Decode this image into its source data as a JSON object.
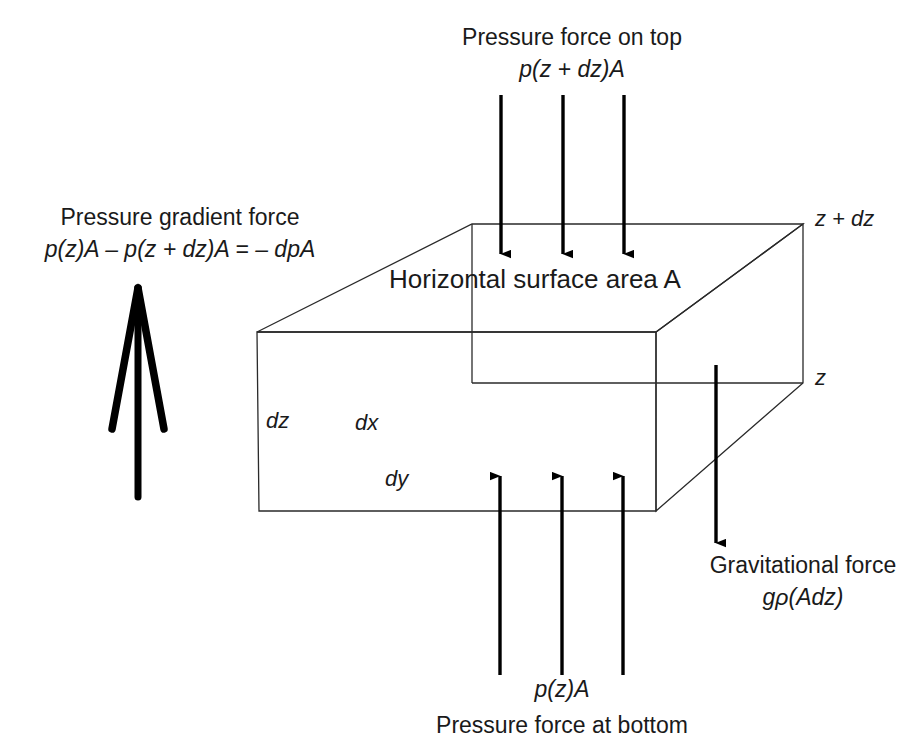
{
  "figure": {
    "type": "physics-force-balance-diagram",
    "background_color": "#ffffff",
    "line_color": "#1a1a1a",
    "arrow_color": "#000000"
  },
  "labels": {
    "top_force_title": "Pressure force on top",
    "top_force_formula": "p(z + dz)A",
    "bottom_force_formula": "p(z)A",
    "bottom_force_title": "Pressure force at bottom",
    "gradient_force_title": "Pressure gradient force",
    "gradient_force_formula": "p(z)A – p(z + dz)A = – dpA",
    "gravity_force_title": "Gravitational force",
    "gravity_force_formula": "gρ(Adz)",
    "surface_area": "Horizontal surface area A",
    "level_top": "z + dz",
    "level_bottom": "z",
    "dim_dz": "dz",
    "dim_dx": "dx",
    "dim_dy": "dy"
  },
  "box": {
    "front_top_left": [
      257,
      332
    ],
    "front_top_right": [
      656,
      332
    ],
    "front_bottom_left": [
      259,
      511
    ],
    "front_bottom_right": [
      656,
      511
    ],
    "back_top_left": [
      472,
      224
    ],
    "back_top_right": [
      803,
      224
    ],
    "back_bottom_right": [
      803,
      383
    ],
    "back_bottom_left": [
      472,
      383
    ]
  },
  "arrows": {
    "top_down": {
      "count": 3,
      "x_positions": [
        501,
        563,
        624
      ],
      "y_start": 95,
      "y_end": 255,
      "direction": "down"
    },
    "bottom_up": {
      "count": 3,
      "x_positions": [
        500,
        562,
        623
      ],
      "y_start": 675,
      "y_end": 474,
      "direction": "up"
    },
    "gravity": {
      "x": 716,
      "y_start": 365,
      "y_end": 545,
      "direction": "down"
    },
    "pressure_gradient": {
      "tip": [
        138,
        285
      ],
      "shaft_end": [
        138,
        497
      ],
      "head_left_end": [
        112,
        430
      ],
      "head_right_end": [
        164,
        430
      ],
      "direction": "up"
    }
  }
}
